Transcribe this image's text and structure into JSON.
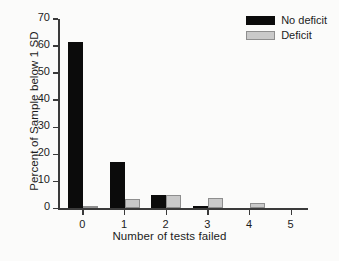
{
  "chart_data": {
    "type": "bar",
    "title": "",
    "xlabel": "Number of tests failed",
    "ylabel": "Percent of Sample below 1 SD",
    "categories": [
      "0",
      "1",
      "2",
      "3",
      "4",
      "5"
    ],
    "x": [
      0,
      1,
      2,
      3,
      4,
      5
    ],
    "series": [
      {
        "name": "No deficit",
        "color": "#0b0b0b",
        "values": [
          61.5,
          17.0,
          5.0,
          1.0,
          0.0,
          0.0
        ]
      },
      {
        "name": "Deficit",
        "color": "#c9c9c9",
        "values": [
          1.0,
          3.5,
          5.0,
          4.0,
          2.0,
          0.0
        ]
      }
    ],
    "ylim": [
      0,
      70
    ],
    "yticks": [
      0,
      10,
      20,
      30,
      40,
      50,
      60,
      70
    ],
    "ytick_labels": [
      "0",
      "10",
      "20",
      "30",
      "40",
      "50",
      "60",
      "70"
    ],
    "xticks": [
      0,
      1,
      2,
      3,
      4,
      5
    ],
    "xtick_labels": [
      "0",
      "1",
      "2",
      "3",
      "4",
      "5"
    ],
    "xlim": [
      -0.6,
      5.4
    ],
    "grid": false,
    "legend_position": "top-right",
    "legend_entries": [
      "No deficit",
      "Deficit"
    ],
    "annotations": []
  },
  "legend": {
    "entries": [
      {
        "label": "No deficit",
        "swatch": "no-deficit"
      },
      {
        "label": "Deficit",
        "swatch": "deficit"
      }
    ]
  }
}
